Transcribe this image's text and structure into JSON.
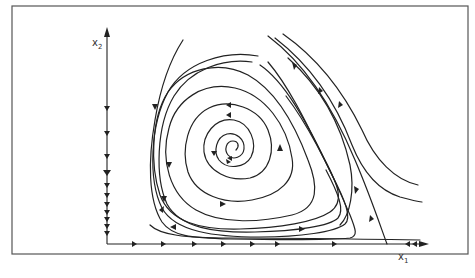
{
  "figure": {
    "type": "phase-portrait",
    "axes": {
      "x_label": "x",
      "x_subscript": "1",
      "y_label": "x",
      "y_subscript": "2"
    },
    "colors": {
      "stroke": "#222222",
      "frame": "#555555",
      "background": "#ffffff"
    }
  }
}
